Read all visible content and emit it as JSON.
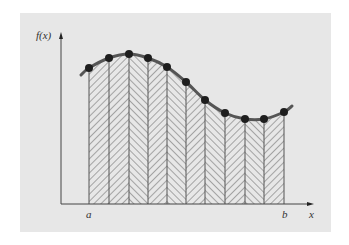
{
  "figure": {
    "labels": {
      "y_axis": "f(x)",
      "x_axis": "x",
      "lower_limit": "a",
      "upper_limit": "b"
    },
    "colors": {
      "page_background": "#ffffff",
      "panel_background": "#e7e7e7",
      "curve": "#555555",
      "node": "#1e1e1e",
      "axis": "#444444",
      "hatch": "#6a6a6a",
      "strip_border": "#555555"
    }
  },
  "chart_data": {
    "type": "area",
    "title": "",
    "xlabel": "x",
    "ylabel": "f(x)",
    "x_ticks": [
      "a",
      "b"
    ],
    "nodes_px": [
      {
        "x": 89,
        "y": 68
      },
      {
        "x": 109,
        "y": 58
      },
      {
        "x": 129,
        "y": 54
      },
      {
        "x": 148,
        "y": 58
      },
      {
        "x": 167,
        "y": 67
      },
      {
        "x": 186,
        "y": 82
      },
      {
        "x": 205,
        "y": 100
      },
      {
        "x": 225,
        "y": 113
      },
      {
        "x": 245,
        "y": 119
      },
      {
        "x": 264,
        "y": 119
      },
      {
        "x": 284,
        "y": 112
      }
    ],
    "curve_start_px": {
      "x": 81,
      "y": 75
    },
    "curve_end_px": {
      "x": 292,
      "y": 106
    },
    "hatch_directions": [
      "back",
      "back",
      "fwd",
      "back",
      "fwd",
      "back",
      "fwd",
      "back",
      "fwd",
      "back"
    ],
    "axis_origin_px": {
      "x": 61,
      "y": 204
    },
    "y_axis_top_px": 33,
    "x_axis_right_px": 313,
    "grid": false,
    "legend": null
  }
}
